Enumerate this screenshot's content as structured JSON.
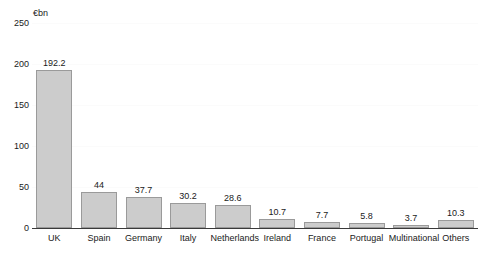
{
  "chart_data": {
    "type": "bar",
    "title": "",
    "subtitle": "",
    "xlabel": "",
    "ylabel": "€bn",
    "unit_label": "€bn",
    "ylim": [
      0,
      250
    ],
    "ytick_labels": [
      "0",
      "50",
      "100",
      "150",
      "200",
      "250"
    ],
    "ytick_values": [
      0,
      50,
      100,
      150,
      200,
      250
    ],
    "grid": false,
    "legend": null,
    "legend_position": "none",
    "categories": [
      "UK",
      "Spain",
      "Germany",
      "Italy",
      "Netherlands",
      "Ireland",
      "France",
      "Portugal",
      "Multinational",
      "Others"
    ],
    "values": [
      192.2,
      44,
      37.7,
      30.2,
      28.6,
      10.7,
      7.7,
      5.8,
      3.7,
      10.3
    ],
    "value_labels": [
      "192.2",
      "44",
      "37.7",
      "30.2",
      "28.6",
      "10.7",
      "7.7",
      "5.8",
      "3.7",
      "10.3"
    ],
    "bar_fill_color": "#cccccc",
    "bar_border_color": "#9a9a9a",
    "axis_color": "#3a3a3a",
    "text_color": "#1a1a1a",
    "background_color": "#ffffff"
  }
}
